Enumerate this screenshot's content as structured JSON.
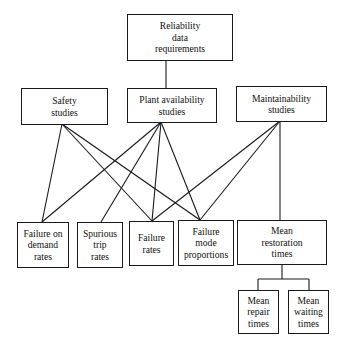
{
  "diagram": {
    "type": "hierarchy",
    "nodes": {
      "root": {
        "label": "Reliability\ndata\nrequirements"
      },
      "safety": {
        "label": "Safety\nstudies"
      },
      "plant": {
        "label": "Plant availability\nstudies"
      },
      "maint": {
        "label": "Maintainability\nstudies"
      },
      "fod": {
        "label": "Failure on\ndemand\nrates"
      },
      "spur": {
        "label": "Spurious\ntrip\nrates"
      },
      "fr": {
        "label": "Failure\nrates"
      },
      "fmp": {
        "label": "Failure\nmode\nproportions"
      },
      "mrt": {
        "label": "Mean\nrestoration\ntimes"
      },
      "repair": {
        "label": "Mean\nrepair\ntimes"
      },
      "wait": {
        "label": "Mean\nwaiting\ntimes"
      }
    },
    "edges": [
      [
        "root",
        "plant"
      ],
      [
        "safety",
        "fod"
      ],
      [
        "safety",
        "fr"
      ],
      [
        "safety",
        "fmp"
      ],
      [
        "plant",
        "fod"
      ],
      [
        "plant",
        "spur"
      ],
      [
        "plant",
        "fr"
      ],
      [
        "plant",
        "fmp"
      ],
      [
        "maint",
        "fr"
      ],
      [
        "maint",
        "fmp"
      ],
      [
        "maint",
        "mrt"
      ],
      [
        "mrt",
        "repair"
      ],
      [
        "mrt",
        "wait"
      ]
    ]
  }
}
